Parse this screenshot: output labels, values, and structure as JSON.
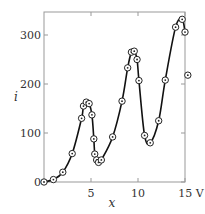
{
  "chart_data": {
    "type": "line",
    "title": "",
    "xlabel": "x",
    "ylabel": "i",
    "x_unit_label": "V",
    "xlim": [
      0,
      15
    ],
    "ylim": [
      0,
      350
    ],
    "xticks": [
      "5",
      "10",
      "15 V"
    ],
    "xtick_values": [
      5,
      10,
      15
    ],
    "yticks": [
      "0",
      "100",
      "200",
      "300"
    ],
    "ytick_values": [
      0,
      100,
      200,
      300
    ],
    "grid": false,
    "legend": null,
    "series": [
      {
        "name": "measured",
        "marker": "circle-dot",
        "x": [
          0,
          1,
          2,
          3,
          4,
          4.2,
          4.5,
          4.8,
          5.1,
          5.3,
          5.4,
          5.6,
          5.8,
          6.1,
          7.3,
          8.3,
          8.9,
          9.3,
          9.6,
          9.9,
          10.1,
          10.7,
          11.3,
          12.2,
          12.9,
          14.0,
          14.7,
          15.0,
          15.3
        ],
        "y": [
          0,
          5,
          20,
          58,
          130,
          155,
          163,
          160,
          137,
          88,
          57,
          45,
          40,
          45,
          92,
          165,
          233,
          265,
          267,
          250,
          207,
          95,
          80,
          125,
          208,
          316,
          332,
          306,
          218
        ]
      }
    ]
  }
}
